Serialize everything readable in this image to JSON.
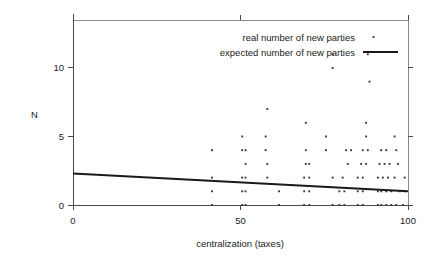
{
  "chart_data": {
    "type": "scatter",
    "title": "",
    "xlabel": "centralization (taxes)",
    "ylabel": "N",
    "xlim": [
      0,
      100
    ],
    "ylim": [
      0,
      13.5
    ],
    "xticks": [
      0,
      50,
      100
    ],
    "xtick_labels": [
      "0",
      "50",
      "100"
    ],
    "yticks": [
      0,
      5,
      10
    ],
    "ytick_labels": [
      "0",
      "5",
      "10"
    ],
    "grid": false,
    "legend_position": "top-right",
    "legend": [
      {
        "name": "real number of new parties",
        "marker": "dot"
      },
      {
        "name": "expected number of new parties",
        "marker": "line"
      }
    ],
    "series": [
      {
        "name": "real number of new parties",
        "type": "scatter",
        "marker": "dot",
        "color": "#3a3a3a",
        "points": [
          [
            41.5,
            0.0
          ],
          [
            50.5,
            0.0
          ],
          [
            51.5,
            0.0
          ],
          [
            61.5,
            0.0
          ],
          [
            69.0,
            0.0
          ],
          [
            70.5,
            0.0
          ],
          [
            77.5,
            0.0
          ],
          [
            79.5,
            0.0
          ],
          [
            81.0,
            0.0
          ],
          [
            85.0,
            0.0
          ],
          [
            86.5,
            0.0
          ],
          [
            91.0,
            0.0
          ],
          [
            92.0,
            0.0
          ],
          [
            93.5,
            0.0
          ],
          [
            95.0,
            0.0
          ],
          [
            96.5,
            0.0
          ],
          [
            98.5,
            0.0
          ],
          [
            41.5,
            1.0
          ],
          [
            50.5,
            1.0
          ],
          [
            51.5,
            1.0
          ],
          [
            61.5,
            1.0
          ],
          [
            69.0,
            1.0
          ],
          [
            70.5,
            1.0
          ],
          [
            79.5,
            1.0
          ],
          [
            81.0,
            1.0
          ],
          [
            85.0,
            1.0
          ],
          [
            86.5,
            1.0
          ],
          [
            91.0,
            1.0
          ],
          [
            92.0,
            1.0
          ],
          [
            93.5,
            1.0
          ],
          [
            95.0,
            1.0
          ],
          [
            97.5,
            1.0
          ],
          [
            99.0,
            1.0
          ],
          [
            41.5,
            2.0
          ],
          [
            50.5,
            2.0
          ],
          [
            51.5,
            2.0
          ],
          [
            58.0,
            2.0
          ],
          [
            69.0,
            2.0
          ],
          [
            70.5,
            2.0
          ],
          [
            77.5,
            2.0
          ],
          [
            80.5,
            2.0
          ],
          [
            85.0,
            2.0
          ],
          [
            86.5,
            2.0
          ],
          [
            91.0,
            2.0
          ],
          [
            92.5,
            2.0
          ],
          [
            94.0,
            2.0
          ],
          [
            96.0,
            2.0
          ],
          [
            99.0,
            2.0
          ],
          [
            51.5,
            3.0
          ],
          [
            58.0,
            3.0
          ],
          [
            69.5,
            3.0
          ],
          [
            70.5,
            3.0
          ],
          [
            82.0,
            3.0
          ],
          [
            86.0,
            3.0
          ],
          [
            87.5,
            3.0
          ],
          [
            91.5,
            3.0
          ],
          [
            93.0,
            3.0
          ],
          [
            94.5,
            3.0
          ],
          [
            97.0,
            3.0
          ],
          [
            41.5,
            4.0
          ],
          [
            50.5,
            4.0
          ],
          [
            51.5,
            4.0
          ],
          [
            57.5,
            4.0
          ],
          [
            69.5,
            4.0
          ],
          [
            75.5,
            4.0
          ],
          [
            81.5,
            4.0
          ],
          [
            83.0,
            4.0
          ],
          [
            86.5,
            4.0
          ],
          [
            88.0,
            4.0
          ],
          [
            92.0,
            4.0
          ],
          [
            93.5,
            4.0
          ],
          [
            96.5,
            4.0
          ],
          [
            50.5,
            5.0
          ],
          [
            57.5,
            5.0
          ],
          [
            75.5,
            5.0
          ],
          [
            87.5,
            5.0
          ],
          [
            96.0,
            5.0
          ],
          [
            69.5,
            6.0
          ],
          [
            87.5,
            6.0
          ],
          [
            58.0,
            7.0
          ],
          [
            88.5,
            9.0
          ],
          [
            77.5,
            10.0
          ],
          [
            77.5,
            11.0
          ],
          [
            88.0,
            11.0
          ]
        ]
      },
      {
        "name": "expected number of new parties",
        "type": "line",
        "color": "#1a1a1a",
        "x": [
          0,
          100
        ],
        "values": [
          2.3,
          1.0
        ]
      }
    ]
  }
}
